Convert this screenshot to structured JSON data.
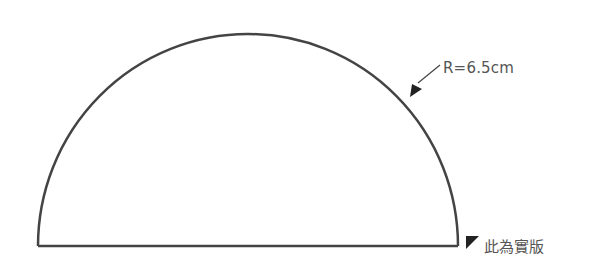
{
  "diagram": {
    "shape": "semicircle",
    "radius_label": "R=6.5cm",
    "note_label": "此為實版",
    "stroke_color": "#444444",
    "arrow_color": "#333333",
    "marker_color": "#222222"
  }
}
